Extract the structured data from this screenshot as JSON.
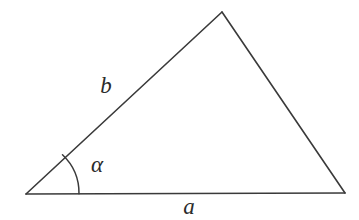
{
  "figure": {
    "canvas": {
      "width": 359,
      "height": 220,
      "background": "#ffffff"
    },
    "stroke": {
      "color": "#3a3a3a",
      "width": 1.6
    }
  },
  "chart_data": {
    "type": "diagram",
    "subtype": "geometric-triangle",
    "title": "",
    "xlabel": "",
    "ylabel": "",
    "grid": false,
    "legend": "none",
    "vertices": [
      {
        "name": "A",
        "role": "left-vertex",
        "x": 26,
        "y": 194
      },
      {
        "name": "B",
        "role": "apex-vertex",
        "x": 222,
        "y": 12
      },
      {
        "name": "C",
        "role": "right-vertex",
        "x": 345,
        "y": 193
      }
    ],
    "edges": [
      {
        "name": "base-side",
        "label": "a",
        "from": "A",
        "to": "C"
      },
      {
        "name": "left-side",
        "label": "b",
        "from": "A",
        "to": "B"
      },
      {
        "name": "right-side",
        "label": "",
        "from": "B",
        "to": "C"
      }
    ],
    "angles": [
      {
        "name": "alpha",
        "label": "α",
        "at_vertex": "A",
        "arc_radius": 53
      }
    ]
  },
  "labels": {
    "side_a": {
      "text": "a",
      "x": 189,
      "y": 209
    },
    "side_b": {
      "text": "b",
      "x": 106,
      "y": 88
    },
    "angle_alpha": {
      "text": "α",
      "x": 97,
      "y": 167
    }
  },
  "geometry": {
    "base_path": "M 26 194 L 345 193",
    "left_side_path": "M 26 194 L 222 12",
    "right_side_path": "M 222 12 L 345 193",
    "arc_path": "M 79.0 193.7 A 53 53 0 0 0 62.5 154.7"
  }
}
